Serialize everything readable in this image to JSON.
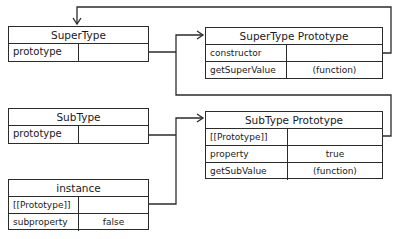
{
  "boxes": {
    "supertype": {
      "title": "SuperType",
      "rows": [
        {
          "key": "prototype",
          "value": ""
        }
      ]
    },
    "supertype_prototype": {
      "title": "SuperType Prototype",
      "rows": [
        {
          "key": "constructor",
          "value": ""
        },
        {
          "key": "getSuperValue",
          "value": "(function)"
        }
      ]
    },
    "subtype": {
      "title": "SubType",
      "rows": [
        {
          "key": "prototype",
          "value": ""
        }
      ]
    },
    "subtype_prototype": {
      "title": "SubType Prototype",
      "rows": [
        {
          "key": "[[Prototype]]",
          "value": ""
        },
        {
          "key": "property",
          "value": "true"
        },
        {
          "key": "getSubValue",
          "value": "(function)"
        }
      ]
    },
    "instance": {
      "title": "instance",
      "rows": [
        {
          "key": "[[Prototype]]",
          "value": ""
        },
        {
          "key": "subproperty",
          "value": "false"
        }
      ]
    }
  },
  "connections": [
    {
      "from": "SuperType.prototype",
      "to": "SuperType Prototype"
    },
    {
      "from": "SuperType Prototype.constructor",
      "to": "SuperType"
    },
    {
      "from": "SubType.prototype",
      "to": "SubType Prototype"
    },
    {
      "from": "SubType Prototype.[[Prototype]]",
      "to": "SuperType Prototype"
    },
    {
      "from": "instance.[[Prototype]]",
      "to": "SubType Prototype"
    }
  ],
  "colors": {
    "line": "#2b2b2b",
    "background": "#ffffff"
  }
}
